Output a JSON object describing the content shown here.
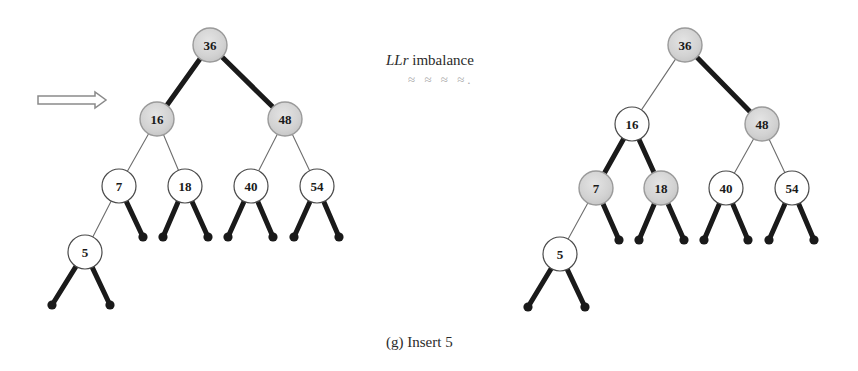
{
  "figure": {
    "caption": "(g) Insert 5",
    "annotation_prefix": "LLr",
    "annotation_suffix": " imbalance",
    "smudge_marks": "≈ ≈ ≈ ≈.",
    "background_color": "#ffffff",
    "ink_color": "#1a1a1a",
    "shaded_node_fill": "#d2d2d2",
    "plain_node_fill": "#ffffff",
    "thin_edge_color": "#6e6e6e",
    "arrow_color": "#8a8a8a"
  },
  "arrow": {
    "name": "transform-arrow",
    "direction": "right",
    "x1": 38,
    "x2": 106,
    "y": 100
  },
  "trees": [
    {
      "id": "before-tree",
      "label": "AVL tree before rotation",
      "nodes": [
        {
          "key": "36",
          "cx": 210,
          "cy": 45,
          "r": 17,
          "shaded": true
        },
        {
          "key": "16",
          "cx": 157,
          "cy": 119,
          "r": 17,
          "shaded": true
        },
        {
          "key": "48",
          "cx": 285,
          "cy": 119,
          "r": 17,
          "shaded": true
        },
        {
          "key": "7",
          "cx": 119,
          "cy": 186,
          "r": 17,
          "shaded": false
        },
        {
          "key": "18",
          "cx": 185,
          "cy": 186,
          "r": 17,
          "shaded": false
        },
        {
          "key": "40",
          "cx": 251,
          "cy": 186,
          "r": 17,
          "shaded": false
        },
        {
          "key": "54",
          "cx": 317,
          "cy": 186,
          "r": 17,
          "shaded": false
        },
        {
          "key": "5",
          "cx": 85,
          "cy": 252,
          "r": 17,
          "shaded": false
        }
      ],
      "edges": [
        {
          "from": "36",
          "to": "16",
          "thick": true
        },
        {
          "from": "36",
          "to": "48",
          "thick": true
        },
        {
          "from": "16",
          "to": "7",
          "thick": false
        },
        {
          "from": "16",
          "to": "18",
          "thick": false
        },
        {
          "from": "48",
          "to": "40",
          "thick": false
        },
        {
          "from": "48",
          "to": "54",
          "thick": false
        },
        {
          "from": "7",
          "to": "5",
          "thick": false
        }
      ],
      "leaf_stubs": [
        {
          "from": "7",
          "x": 143,
          "y": 237,
          "thick": true
        },
        {
          "from": "18",
          "x": 163,
          "y": 237,
          "thick": true
        },
        {
          "from": "18",
          "x": 208,
          "y": 237,
          "thick": true
        },
        {
          "from": "40",
          "x": 228,
          "y": 237,
          "thick": true
        },
        {
          "from": "40",
          "x": 273,
          "y": 237,
          "thick": true
        },
        {
          "from": "54",
          "x": 294,
          "y": 237,
          "thick": true
        },
        {
          "from": "54",
          "x": 339,
          "y": 237,
          "thick": true
        },
        {
          "from": "5",
          "x": 52,
          "y": 305,
          "thick": true
        },
        {
          "from": "5",
          "x": 110,
          "y": 305,
          "thick": true
        }
      ]
    },
    {
      "id": "after-tree",
      "label": "AVL tree after rotation",
      "nodes": [
        {
          "key": "36",
          "cx": 685,
          "cy": 45,
          "r": 17,
          "shaded": true
        },
        {
          "key": "16",
          "cx": 632,
          "cy": 124,
          "r": 17,
          "shaded": false
        },
        {
          "key": "48",
          "cx": 762,
          "cy": 124,
          "r": 17,
          "shaded": true
        },
        {
          "key": "7",
          "cx": 596,
          "cy": 188,
          "r": 17,
          "shaded": true
        },
        {
          "key": "18",
          "cx": 661,
          "cy": 188,
          "r": 17,
          "shaded": true
        },
        {
          "key": "40",
          "cx": 726,
          "cy": 188,
          "r": 17,
          "shaded": false
        },
        {
          "key": "54",
          "cx": 792,
          "cy": 188,
          "r": 17,
          "shaded": false
        },
        {
          "key": "5",
          "cx": 560,
          "cy": 254,
          "r": 17,
          "shaded": false
        }
      ],
      "edges": [
        {
          "from": "36",
          "to": "16",
          "thick": false
        },
        {
          "from": "36",
          "to": "48",
          "thick": true
        },
        {
          "from": "16",
          "to": "7",
          "thick": true
        },
        {
          "from": "16",
          "to": "18",
          "thick": true
        },
        {
          "from": "48",
          "to": "40",
          "thick": false
        },
        {
          "from": "48",
          "to": "54",
          "thick": false
        },
        {
          "from": "7",
          "to": "5",
          "thick": false
        }
      ],
      "leaf_stubs": [
        {
          "from": "7",
          "x": 619,
          "y": 240,
          "thick": true
        },
        {
          "from": "18",
          "x": 639,
          "y": 240,
          "thick": true
        },
        {
          "from": "18",
          "x": 684,
          "y": 240,
          "thick": true
        },
        {
          "from": "40",
          "x": 704,
          "y": 240,
          "thick": true
        },
        {
          "from": "40",
          "x": 748,
          "y": 240,
          "thick": true
        },
        {
          "from": "54",
          "x": 769,
          "y": 240,
          "thick": true
        },
        {
          "from": "54",
          "x": 814,
          "y": 240,
          "thick": true
        },
        {
          "from": "5",
          "x": 528,
          "y": 307,
          "thick": true
        },
        {
          "from": "5",
          "x": 585,
          "y": 307,
          "thick": true
        }
      ]
    }
  ]
}
